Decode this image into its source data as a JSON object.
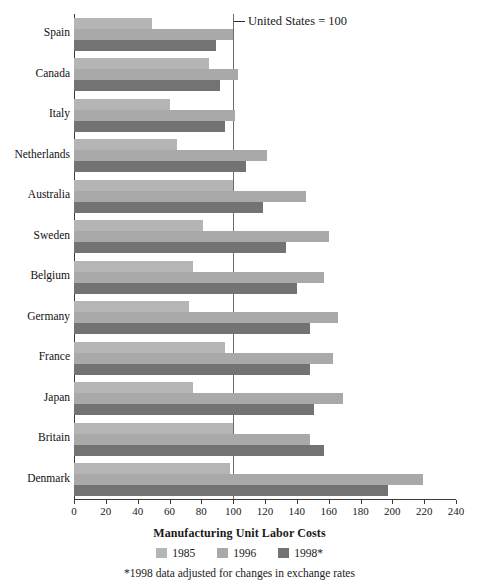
{
  "chart_data": {
    "type": "bar",
    "orientation": "horizontal",
    "title": "",
    "xlabel": "Manufacturing Unit Labor Costs",
    "ylabel": "",
    "xlim": [
      0,
      240
    ],
    "xticks": [
      0,
      20,
      40,
      60,
      80,
      100,
      120,
      140,
      160,
      180,
      200,
      220,
      240
    ],
    "grid": false,
    "reference_line": {
      "value": 100,
      "label": "United States = 100"
    },
    "legend_position": "bottom",
    "footnote": "*1998 data adjusted for changes in exchange rates",
    "categories": [
      "Spain",
      "Canada",
      "Italy",
      "Netherlands",
      "Australia",
      "Sweden",
      "Belgium",
      "Germany",
      "France",
      "Japan",
      "Britain",
      "Denmark"
    ],
    "series": [
      {
        "name": "1985",
        "color": "#b5b5b5",
        "values": [
          49,
          85,
          60,
          65,
          100,
          81,
          75,
          72,
          95,
          75,
          100,
          98
        ]
      },
      {
        "name": "1996",
        "color": "#a9a9a9",
        "values": [
          100,
          103,
          101,
          121,
          146,
          160,
          157,
          166,
          163,
          169,
          148,
          219
        ]
      },
      {
        "name": "1998*",
        "color": "#737373",
        "values": [
          89,
          92,
          95,
          108,
          119,
          133,
          140,
          148,
          148,
          151,
          157,
          197
        ]
      }
    ]
  },
  "annotation": {
    "us_baseline": "United States = 100"
  },
  "axis": {
    "title": "Manufacturing Unit Labor Costs"
  },
  "footnote": {
    "text": "*1998 data adjusted for changes in exchange rates"
  }
}
